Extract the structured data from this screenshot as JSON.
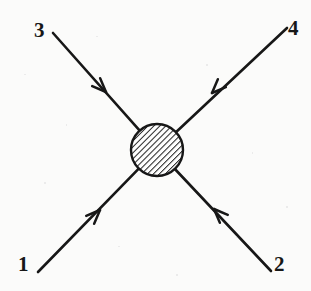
{
  "figure": {
    "kind": "feynman-diagram",
    "background_color": "#fbfbfa",
    "ink_color": "#171717",
    "canvas": {
      "width": 311,
      "height": 291
    }
  },
  "blob": {
    "name": "interaction-blob",
    "center_x": 157,
    "center_y": 150,
    "radius": 26,
    "fill_style": "diagonal-hatch",
    "hatch_angle_deg": 45,
    "hatch_spacing_px": 3,
    "stroke_color": "#171717",
    "stroke_width": 2.4
  },
  "legs": [
    {
      "id": "leg-1",
      "label": "1",
      "label_x": 25,
      "label_y": 266,
      "corner": "bottom-left",
      "outer_x": 38,
      "outer_y": 272,
      "arrow_x": 100,
      "arrow_y": 210,
      "arrow_direction": "toward-vertex",
      "arrow_heading_deg": -45
    },
    {
      "id": "leg-2",
      "label": "2",
      "label_x": 281,
      "label_y": 266,
      "corner": "bottom-right",
      "outer_x": 271,
      "outer_y": 271,
      "arrow_x": 214,
      "arrow_y": 209,
      "arrow_direction": "toward-vertex",
      "arrow_heading_deg": -135
    },
    {
      "id": "leg-3",
      "label": "3",
      "label_x": 41,
      "label_y": 32,
      "corner": "top-left",
      "outer_x": 53,
      "outer_y": 33,
      "arrow_x": 106,
      "arrow_y": 92,
      "arrow_direction": "toward-vertex",
      "arrow_heading_deg": 45
    },
    {
      "id": "leg-4",
      "label": "4",
      "label_x": 295,
      "label_y": 30,
      "corner": "top-right",
      "outer_x": 287,
      "outer_y": 28,
      "arrow_x": 212,
      "arrow_y": 93,
      "arrow_direction": "toward-vertex",
      "arrow_heading_deg": 135
    }
  ],
  "line_style": {
    "stroke_color": "#171717",
    "stroke_width": 2.6,
    "arrow_length_px": 15,
    "arrow_half_angle_deg": 22
  }
}
